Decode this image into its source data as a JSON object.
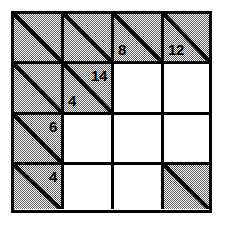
{
  "puzzle": {
    "type": "kakuro-grid",
    "rows": 4,
    "cols": 4,
    "colors": {
      "ink": "#000000",
      "clue_fill": "#808080",
      "open_fill": "#ffffff",
      "border": "#000000"
    },
    "cells": [
      {
        "id": "r1c1",
        "row": 1,
        "col": 1,
        "kind": "clue",
        "diagonal": true,
        "down": "",
        "across": ""
      },
      {
        "id": "r1c2",
        "row": 1,
        "col": 2,
        "kind": "clue",
        "diagonal": true,
        "down": "",
        "across": ""
      },
      {
        "id": "r1c3",
        "row": 1,
        "col": 3,
        "kind": "clue",
        "diagonal": true,
        "down": "",
        "across": "8"
      },
      {
        "id": "r1c4",
        "row": 1,
        "col": 4,
        "kind": "clue",
        "diagonal": true,
        "down": "",
        "across": "12"
      },
      {
        "id": "r2c1",
        "row": 2,
        "col": 1,
        "kind": "clue",
        "diagonal": true,
        "down": "",
        "across": ""
      },
      {
        "id": "r2c2",
        "row": 2,
        "col": 2,
        "kind": "clue",
        "diagonal": true,
        "down": "14",
        "across": "4"
      },
      {
        "id": "r2c3",
        "row": 2,
        "col": 3,
        "kind": "open",
        "diagonal": false,
        "value": ""
      },
      {
        "id": "r2c4",
        "row": 2,
        "col": 4,
        "kind": "open",
        "diagonal": false,
        "value": ""
      },
      {
        "id": "r3c1",
        "row": 3,
        "col": 1,
        "kind": "clue",
        "diagonal": true,
        "down": "6",
        "across": ""
      },
      {
        "id": "r3c2",
        "row": 3,
        "col": 2,
        "kind": "open",
        "diagonal": false,
        "value": ""
      },
      {
        "id": "r3c3",
        "row": 3,
        "col": 3,
        "kind": "open",
        "diagonal": false,
        "value": ""
      },
      {
        "id": "r3c4",
        "row": 3,
        "col": 4,
        "kind": "open",
        "diagonal": false,
        "value": ""
      },
      {
        "id": "r4c1",
        "row": 4,
        "col": 1,
        "kind": "clue",
        "diagonal": true,
        "down": "4",
        "across": ""
      },
      {
        "id": "r4c2",
        "row": 4,
        "col": 2,
        "kind": "open",
        "diagonal": false,
        "value": ""
      },
      {
        "id": "r4c3",
        "row": 4,
        "col": 3,
        "kind": "open",
        "diagonal": false,
        "value": ""
      },
      {
        "id": "r4c4",
        "row": 4,
        "col": 4,
        "kind": "clue",
        "diagonal": true,
        "down": "",
        "across": ""
      }
    ],
    "clue_numbers": [
      {
        "cell": "r1c3",
        "position": "lower-left",
        "text": "8"
      },
      {
        "cell": "r1c4",
        "position": "lower-left",
        "text": "12"
      },
      {
        "cell": "r2c2",
        "position": "upper-right",
        "text": "14"
      },
      {
        "cell": "r2c2",
        "position": "lower-left",
        "text": "4"
      },
      {
        "cell": "r3c1",
        "position": "upper-right",
        "text": "6"
      },
      {
        "cell": "r4c1",
        "position": "upper-right",
        "text": "4"
      }
    ]
  }
}
